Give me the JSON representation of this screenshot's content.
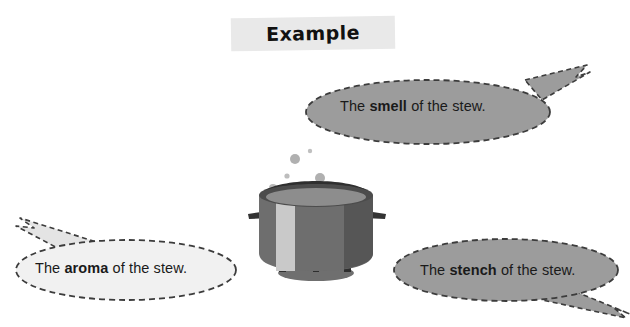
{
  "page": {
    "background_color": "#ffffff",
    "width": 630,
    "height": 327
  },
  "header": {
    "label": "Example",
    "band_color": "#e9e9e9",
    "text_color": "#111111"
  },
  "illustration": {
    "name": "cooking-pot-with-steam",
    "pot_body_color": "#6e6e6e",
    "pot_shadow_color": "#5a5a5a",
    "pot_highlight_color": "#c8c8c8",
    "rim_color": "#4a4a4a",
    "steam_color": "#b4b4b4",
    "flame_color": "#bdbdbd",
    "steam_bubble_count": 6
  },
  "bubbles": [
    {
      "id": "smell",
      "prefix": "The ",
      "keyword": "smell",
      "suffix": " of the stew.",
      "fill_color": "#9c9c9c",
      "border_color": "#3c3c3c",
      "text_color": "#1a1a1a",
      "tail_direction": "up-right"
    },
    {
      "id": "aroma",
      "prefix": "The ",
      "keyword": "aroma",
      "suffix": " of the stew.",
      "fill_color": "#f1f1f1",
      "border_color": "#3c3c3c",
      "text_color": "#1a1a1a",
      "tail_direction": "up-left"
    },
    {
      "id": "stench",
      "prefix": "The ",
      "keyword": "stench",
      "suffix": " of the stew.",
      "fill_color": "#9c9c9c",
      "border_color": "#3c3c3c",
      "text_color": "#1a1a1a",
      "tail_direction": "down-right"
    }
  ]
}
